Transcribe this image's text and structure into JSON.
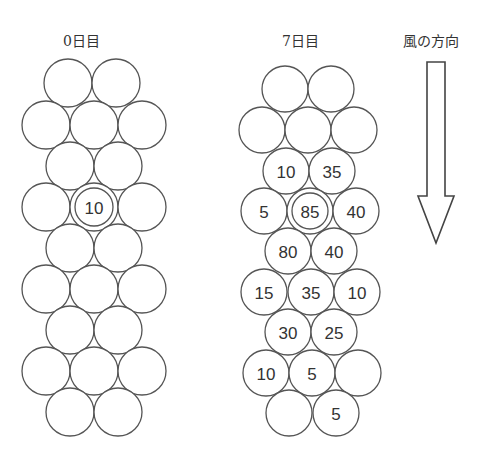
{
  "titles": {
    "day0": "0日目",
    "day7": "7日目",
    "wind": "風の方向"
  },
  "colors": {
    "stroke": "#555555",
    "text": "#333333",
    "background": "#ffffff"
  },
  "wind_arrow": {
    "direction": "down",
    "icon": "down-arrow-icon"
  },
  "grids": [
    {
      "id": "day0",
      "label": "0日目",
      "radius": 24,
      "cells": [
        {
          "row": 1,
          "x": 68,
          "y": 83,
          "value": ""
        },
        {
          "row": 1,
          "x": 116,
          "y": 83,
          "value": ""
        },
        {
          "row": 2,
          "x": 46,
          "y": 125,
          "value": ""
        },
        {
          "row": 2,
          "x": 94,
          "y": 125,
          "value": ""
        },
        {
          "row": 2,
          "x": 142,
          "y": 125,
          "value": ""
        },
        {
          "row": 3,
          "x": 70,
          "y": 166,
          "value": ""
        },
        {
          "row": 3,
          "x": 118,
          "y": 166,
          "value": ""
        },
        {
          "row": 4,
          "x": 46,
          "y": 207,
          "value": ""
        },
        {
          "row": 4,
          "x": 94,
          "y": 207,
          "value": "10",
          "initial": true
        },
        {
          "row": 4,
          "x": 142,
          "y": 207,
          "value": ""
        },
        {
          "row": 5,
          "x": 70,
          "y": 248,
          "value": ""
        },
        {
          "row": 5,
          "x": 118,
          "y": 248,
          "value": ""
        },
        {
          "row": 6,
          "x": 46,
          "y": 289,
          "value": ""
        },
        {
          "row": 6,
          "x": 94,
          "y": 289,
          "value": ""
        },
        {
          "row": 6,
          "x": 142,
          "y": 289,
          "value": ""
        },
        {
          "row": 7,
          "x": 70,
          "y": 330,
          "value": ""
        },
        {
          "row": 7,
          "x": 118,
          "y": 330,
          "value": ""
        },
        {
          "row": 8,
          "x": 46,
          "y": 371,
          "value": ""
        },
        {
          "row": 8,
          "x": 94,
          "y": 371,
          "value": ""
        },
        {
          "row": 8,
          "x": 142,
          "y": 371,
          "value": ""
        },
        {
          "row": 9,
          "x": 70,
          "y": 412,
          "value": ""
        },
        {
          "row": 9,
          "x": 118,
          "y": 412,
          "value": ""
        }
      ]
    },
    {
      "id": "day7",
      "label": "7日目",
      "radius": 23,
      "cells": [
        {
          "row": 1,
          "x": 285,
          "y": 89,
          "value": ""
        },
        {
          "row": 1,
          "x": 331,
          "y": 89,
          "value": ""
        },
        {
          "row": 2,
          "x": 262,
          "y": 130,
          "value": ""
        },
        {
          "row": 2,
          "x": 308,
          "y": 130,
          "value": ""
        },
        {
          "row": 2,
          "x": 354,
          "y": 130,
          "value": ""
        },
        {
          "row": 3,
          "x": 286,
          "y": 171,
          "value": "10"
        },
        {
          "row": 3,
          "x": 332,
          "y": 171,
          "value": "35"
        },
        {
          "row": 4,
          "x": 264,
          "y": 211,
          "value": "5"
        },
        {
          "row": 4,
          "x": 310,
          "y": 211,
          "value": "85",
          "initial": true
        },
        {
          "row": 4,
          "x": 356,
          "y": 211,
          "value": "40"
        },
        {
          "row": 5,
          "x": 288,
          "y": 251,
          "value": "80"
        },
        {
          "row": 5,
          "x": 334,
          "y": 251,
          "value": "40"
        },
        {
          "row": 6,
          "x": 264,
          "y": 292,
          "value": "15"
        },
        {
          "row": 6,
          "x": 311,
          "y": 292,
          "value": "35"
        },
        {
          "row": 6,
          "x": 357,
          "y": 292,
          "value": "10"
        },
        {
          "row": 7,
          "x": 288,
          "y": 332,
          "value": "30"
        },
        {
          "row": 7,
          "x": 334,
          "y": 332,
          "value": "25"
        },
        {
          "row": 8,
          "x": 266,
          "y": 373,
          "value": "10"
        },
        {
          "row": 8,
          "x": 312,
          "y": 373,
          "value": "5"
        },
        {
          "row": 8,
          "x": 358,
          "y": 373,
          "value": ""
        },
        {
          "row": 9,
          "x": 289,
          "y": 413,
          "value": ""
        },
        {
          "row": 9,
          "x": 336,
          "y": 413,
          "value": "5"
        }
      ]
    }
  ]
}
